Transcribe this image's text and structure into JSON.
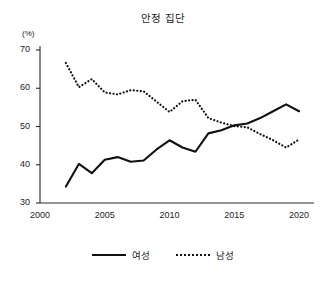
{
  "chart_data": {
    "type": "line",
    "title": "안정 집단",
    "xlabel": "",
    "ylabel": "",
    "y_unit": "(%)",
    "xlim": [
      2000,
      2021
    ],
    "ylim": [
      30,
      70
    ],
    "grid": false,
    "legend_position": "bottom",
    "x_ticks": [
      "2000",
      "2005",
      "2010",
      "2015",
      "2020"
    ],
    "x_tick_values": [
      2000,
      2005,
      2010,
      2015,
      2020
    ],
    "y_ticks": [
      "30",
      "40",
      "50",
      "60",
      "70"
    ],
    "y_tick_values": [
      30,
      40,
      50,
      60,
      70
    ],
    "x": [
      2002,
      2003,
      2004,
      2005,
      2006,
      2007,
      2008,
      2009,
      2010,
      2011,
      2012,
      2013,
      2014,
      2015,
      2016,
      2017,
      2018,
      2019,
      2020
    ],
    "series": [
      {
        "name": "여성",
        "style": "solid",
        "color": "#111111",
        "values": [
          34.3,
          40.2,
          37.8,
          41.3,
          42.0,
          40.8,
          41.1,
          44.0,
          46.4,
          44.5,
          43.4,
          48.2,
          49.0,
          50.3,
          50.8,
          52.2,
          54.0,
          55.8,
          54.0
        ]
      },
      {
        "name": "남성",
        "style": "dotted",
        "color": "#111111",
        "values": [
          66.6,
          60.3,
          62.4,
          58.9,
          58.4,
          59.5,
          59.2,
          56.5,
          53.8,
          56.6,
          57.0,
          52.2,
          51.0,
          50.1,
          49.8,
          48.0,
          46.4,
          44.5,
          46.6
        ]
      }
    ]
  },
  "legend": {
    "entries": [
      {
        "label": "여성",
        "style": "solid"
      },
      {
        "label": "남성",
        "style": "dotted"
      }
    ]
  }
}
